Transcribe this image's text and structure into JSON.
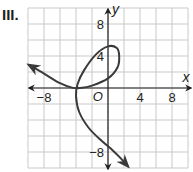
{
  "problem_label": "III.",
  "chart_data": {
    "type": "line",
    "title": "",
    "xlabel": "x",
    "ylabel": "y",
    "xlim": [
      -10,
      10
    ],
    "ylim": [
      -10,
      10
    ],
    "grid": true,
    "grid_step": 2,
    "origin_label": "O",
    "x_ticks": [
      {
        "value": -8,
        "label": "−8"
      },
      {
        "value": 4,
        "label": "4"
      },
      {
        "value": 8,
        "label": "8"
      }
    ],
    "y_ticks": [
      {
        "value": 8,
        "label": "8"
      },
      {
        "value": 4,
        "label": "4"
      },
      {
        "value": -8,
        "label": "−8"
      }
    ],
    "series": [
      {
        "name": "parametric curve",
        "color": "#3a3a3a",
        "arrow_start": true,
        "arrow_end": true,
        "points": [
          [
            -9.9,
            2.9
          ],
          [
            -8,
            1.8
          ],
          [
            -6,
            0.6
          ],
          [
            -4.5,
            0.05
          ],
          [
            -3.5,
            0
          ],
          [
            -2,
            0.3
          ],
          [
            0,
            1.2
          ],
          [
            1.2,
            2.6
          ],
          [
            1.4,
            4
          ],
          [
            1.1,
            5
          ],
          [
            0,
            5.2
          ],
          [
            -1.5,
            4.2
          ],
          [
            -3,
            2.2
          ],
          [
            -3.8,
            0.5
          ],
          [
            -4,
            -1
          ],
          [
            -3.6,
            -3
          ],
          [
            -2.4,
            -5
          ],
          [
            -0.8,
            -6.6
          ],
          [
            0.6,
            -7.8
          ],
          [
            1.6,
            -8.8
          ],
          [
            2.5,
            -9.8
          ]
        ]
      }
    ]
  },
  "colors": {
    "grid": "#c9c9c9",
    "axis": "#231f20",
    "curve": "#3a3a3a"
  }
}
